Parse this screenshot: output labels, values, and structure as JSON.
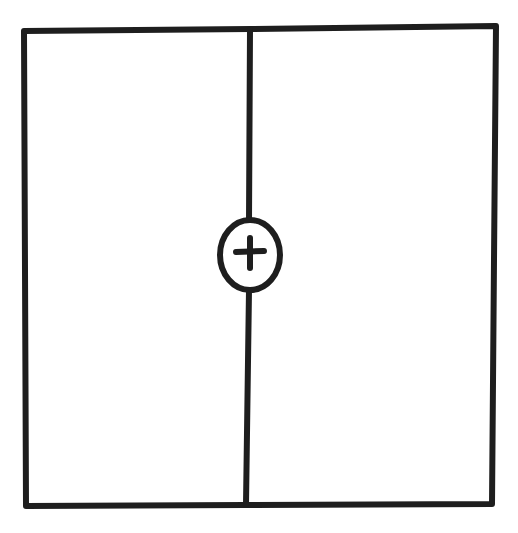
{
  "diagram": {
    "type": "hand-drawn sketch",
    "stroke_color": "#1e1e1e",
    "background_color": "#ffffff",
    "outer_frame": {
      "corners": {
        "top_left": [
          24,
          31
        ],
        "top_right": [
          496,
          26
        ],
        "bottom_right": [
          492,
          504
        ],
        "bottom_left": [
          26,
          506
        ]
      },
      "stroke_width": 6
    },
    "divider": {
      "top": [
        250,
        30
      ],
      "bottom": [
        246,
        504
      ],
      "stroke_width": 6
    },
    "center_marker": {
      "shape": "ellipse",
      "center": [
        250,
        255
      ],
      "rx": 30,
      "ry": 36,
      "stroke_width": 6,
      "symbol": "+",
      "symbol_name": "plus-icon"
    },
    "panels": [
      {
        "name": "left-panel",
        "label": ""
      },
      {
        "name": "right-panel",
        "label": ""
      }
    ]
  }
}
